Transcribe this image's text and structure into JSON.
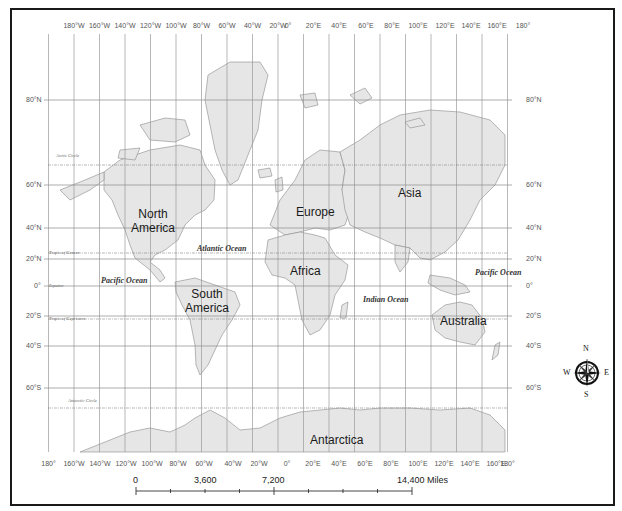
{
  "map": {
    "title": "World Map (Mercator)",
    "colors": {
      "land": "#e6e6e6",
      "coast": "#8a8a8a",
      "grid": "#9a9a9a",
      "frame": "#1a1a1a",
      "text": "#1a1a1a"
    },
    "longitude_labels_top": [
      "180°W",
      "160°W",
      "140°W",
      "120°W",
      "100°W",
      "80°W",
      "60°W",
      "40°W",
      "20°W",
      "0°",
      "20°E",
      "40°E",
      "60°E",
      "80°E",
      "100°E",
      "120°E",
      "140°E",
      "160°E",
      "180°"
    ],
    "longitude_labels_bottom": [
      "180°",
      "160°W",
      "140°W",
      "120°W",
      "100°W",
      "80°W",
      "60°W",
      "40°W",
      "20°W",
      "0°",
      "20°E",
      "40°E",
      "60°E",
      "80°E",
      "100°E",
      "120°E",
      "140°E",
      "160°E",
      "180°"
    ],
    "latitude_labels": [
      "80°N",
      "60°N",
      "40°N",
      "20°N",
      "0°",
      "20°S",
      "40°S",
      "60°S"
    ],
    "special_lines": {
      "arctic_circle": "Arctic Circle",
      "tropic_cancer": "Tropic of Cancer",
      "equator": "Equator",
      "tropic_capricorn": "Tropic of Capricorn",
      "antarctic_circle": "Antarctic Circle"
    },
    "continents": {
      "north_america": [
        "North",
        "America"
      ],
      "south_america": [
        "South",
        "America"
      ],
      "europe": "Europe",
      "asia": "Asia",
      "africa": "Africa",
      "australia": "Australia",
      "antarctica": "Antarctica"
    },
    "oceans": {
      "atlantic": "Atlantic Ocean",
      "pacific_west": "Pacific Ocean",
      "pacific_east": "Pacific Ocean",
      "indian": "Indian Ocean"
    }
  },
  "scale_bar": {
    "labels": [
      "0",
      "3,600",
      "7,200",
      "14,400 Miles"
    ]
  },
  "compass": {
    "n": "N",
    "s": "S",
    "e": "E",
    "w": "W"
  }
}
